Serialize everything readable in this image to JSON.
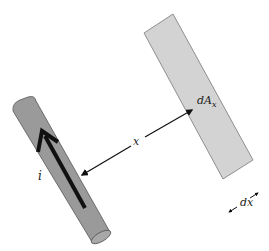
{
  "figure": {
    "labels": {
      "current": "i",
      "area_main": "dA",
      "area_sub": "x",
      "distance": "x",
      "width": "dx"
    },
    "colors": {
      "background": "#ffffff",
      "wire_fill": "#9a9a9a",
      "wire_stroke": "#555555",
      "strip_fill": "#d3d3d3",
      "strip_stroke": "#777777",
      "arrow": "#111111"
    },
    "elements": [
      {
        "name": "wire",
        "description": "Cylindrical current-carrying wire, tilted"
      },
      {
        "name": "current-arrow",
        "description": "Thick arrow along wire pointing up-left"
      },
      {
        "name": "area-strip",
        "description": "Thin rectangular area element dA_x, parallel to wire"
      },
      {
        "name": "distance-arrow",
        "description": "Double-headed arrow between wire and strip labeled x"
      },
      {
        "name": "width-arrows",
        "description": "Small arrows indicating strip width dx"
      }
    ]
  }
}
